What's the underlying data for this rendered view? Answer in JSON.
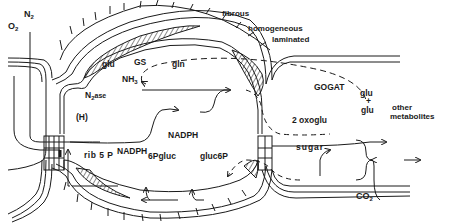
{
  "diagram": {
    "labels": {
      "o2": "O",
      "o2_sub": "2",
      "n2": "N",
      "n2_sub": "2",
      "fibrous": "fibrous",
      "homogeneous": "homogeneous",
      "laminated": "laminated",
      "glu_top": "glu",
      "gs": "GS",
      "gln": "gln",
      "nh3": "NH",
      "nh3_sub": "3",
      "n2ase": "N",
      "n2ase_sub": "2",
      "n2ase_suffix": "ase",
      "h": "(H)",
      "gogat": "GOGAT",
      "glu_right1": "glu",
      "plus": "+",
      "glu_right2": "glu",
      "other": "other",
      "metabolites": "metabolites",
      "oxoglu": "2 oxoglu",
      "sugar": "sugar",
      "nadph_left": "NADPH",
      "nadph_mid": "NADPH",
      "rib5p": "rib 5 P",
      "6pgluc": "6Pgluc",
      "gluc6p": "gluc6P",
      "co2": "CO",
      "co2_sub": "2"
    },
    "colors": {
      "ink": "#1a1a1a",
      "background": "#ffffff"
    }
  }
}
